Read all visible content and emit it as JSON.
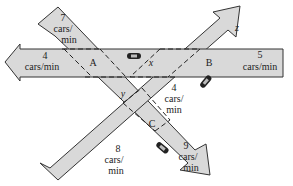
{
  "diagram": {
    "type": "traffic-flow-network",
    "background": "#ffffff",
    "road_fill": "#d9d9d9",
    "road_stroke": "#333333",
    "intersections": [
      {
        "id": "A",
        "label": "A"
      },
      {
        "id": "B",
        "label": "B"
      },
      {
        "id": "C",
        "label": "C"
      }
    ],
    "unknowns": [
      {
        "id": "x",
        "label": "x",
        "between": "A-B"
      },
      {
        "id": "y",
        "label": "y",
        "between": "A-C"
      },
      {
        "id": "z",
        "label": "z",
        "road": "outflow from B (up-right arrow)"
      }
    ],
    "flows": [
      {
        "id": "in_A_top",
        "value": "7",
        "unit_line1": "cars/",
        "unit_line2": "min",
        "direction": "into A"
      },
      {
        "id": "out_A_left",
        "value": "4",
        "unit": "cars/min",
        "direction": "out of A (left arrow)"
      },
      {
        "id": "in_B_right",
        "value": "5",
        "unit": "cars/min",
        "direction": "into B"
      },
      {
        "id": "B_to_C",
        "value": "4",
        "unit_line1": "cars/",
        "unit_line2": "min",
        "direction": "between B and C"
      },
      {
        "id": "in_C_bottom",
        "value": "8",
        "unit_line1": "cars/",
        "unit_line2": "min",
        "direction": "into C"
      },
      {
        "id": "out_C_right",
        "value": "9",
        "unit_line1": "cars/",
        "unit_line2": "min",
        "direction": "out of C (down-right arrow)"
      }
    ],
    "icons": [
      {
        "name": "car-icon",
        "location": "road A-B"
      },
      {
        "name": "car-icon",
        "location": "road B-C"
      },
      {
        "name": "car-icon",
        "location": "road exiting C"
      }
    ]
  }
}
